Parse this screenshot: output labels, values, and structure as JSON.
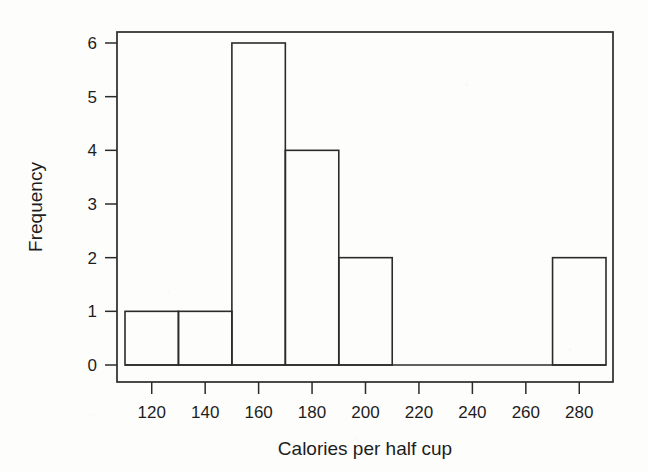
{
  "figure": {
    "background_color": "#fdfdfc",
    "ink_color": "#2b2b2b"
  },
  "chart_data": {
    "type": "bar",
    "chart_subtype": "histogram",
    "title": "",
    "subtitle": "",
    "xlabel": "Calories per half cup",
    "ylabel": "Frequency",
    "xlim": [
      110,
      290
    ],
    "ylim": [
      0,
      6
    ],
    "grid": false,
    "legend": null,
    "legend_position": "none",
    "bin_width": 20,
    "bin_edges": [
      110,
      130,
      150,
      170,
      190,
      210,
      230,
      250,
      270,
      290
    ],
    "categories": [
      "110-130",
      "130-150",
      "150-170",
      "170-190",
      "190-210",
      "210-230",
      "230-250",
      "250-270",
      "270-290"
    ],
    "values": [
      1,
      1,
      6,
      4,
      2,
      0,
      0,
      0,
      2
    ],
    "bars": [
      {
        "x0": 110,
        "x1": 130,
        "frequency": 1
      },
      {
        "x0": 130,
        "x1": 150,
        "frequency": 1
      },
      {
        "x0": 150,
        "x1": 170,
        "frequency": 6
      },
      {
        "x0": 170,
        "x1": 190,
        "frequency": 4
      },
      {
        "x0": 190,
        "x1": 210,
        "frequency": 2
      },
      {
        "x0": 210,
        "x1": 230,
        "frequency": 0
      },
      {
        "x0": 230,
        "x1": 250,
        "frequency": 0
      },
      {
        "x0": 250,
        "x1": 270,
        "frequency": 0
      },
      {
        "x0": 270,
        "x1": 290,
        "frequency": 2
      }
    ],
    "xticks": [
      120,
      140,
      160,
      180,
      200,
      220,
      240,
      260,
      280
    ],
    "xtick_labels": [
      "120",
      "140",
      "160",
      "180",
      "200",
      "220",
      "240",
      "260",
      "280"
    ],
    "yticks": [
      0,
      1,
      2,
      3,
      4,
      5,
      6
    ],
    "ytick_labels": [
      "0",
      "1",
      "2",
      "3",
      "4",
      "5",
      "6"
    ],
    "total_count": 16
  },
  "axes": {
    "x_title": "Calories per half cup",
    "y_title": "Frequency"
  }
}
